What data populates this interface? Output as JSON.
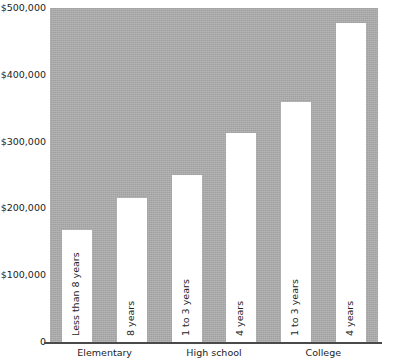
{
  "chart_data": {
    "type": "bar",
    "title": "",
    "subtitle": "",
    "xlabel": "",
    "ylabel": "",
    "ylim": [
      0,
      500000
    ],
    "grid": false,
    "legend": null,
    "orientation": "vertical",
    "bar_color": "#ffffff",
    "plot_background": "#a9a9a9",
    "axis_color": "#4a4a4a",
    "y_ticks": [
      {
        "value": 0,
        "label": "0"
      },
      {
        "value": 100000,
        "label": "$100,000"
      },
      {
        "value": 200000,
        "label": "$200,000"
      },
      {
        "value": 300000,
        "label": "$300,000"
      },
      {
        "value": 400000,
        "label": "$400,000"
      },
      {
        "value": 500000,
        "label": "$500,000"
      }
    ],
    "categories": [
      "Less than 8 years",
      "8 years",
      "1 to 3 years",
      "4 years",
      "1 to 3 years",
      "4 years"
    ],
    "values": [
      168000,
      215000,
      250000,
      313000,
      360000,
      478000
    ],
    "group_labels": [
      "Elementary",
      "High school",
      "College"
    ],
    "groups": [
      {
        "name": "Elementary",
        "bars": [
          0,
          1
        ]
      },
      {
        "name": "High school",
        "bars": [
          2,
          3
        ]
      },
      {
        "name": "College",
        "bars": [
          4,
          5
        ]
      }
    ],
    "bars": [
      {
        "label": "Less than 8 years",
        "value": 168000,
        "group": "Elementary"
      },
      {
        "label": "8 years",
        "value": 215000,
        "group": "Elementary"
      },
      {
        "label": "1 to 3 years",
        "value": 250000,
        "group": "High school"
      },
      {
        "label": "4 years",
        "value": 313000,
        "group": "High school"
      },
      {
        "label": "1 to 3 years",
        "value": 360000,
        "group": "College"
      },
      {
        "label": "4 years",
        "value": 478000,
        "group": "College"
      }
    ]
  }
}
